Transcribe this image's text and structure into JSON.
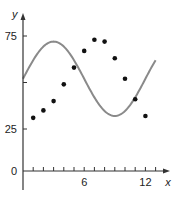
{
  "chart_data": {
    "type": "scatter",
    "title": "",
    "xlabel": "x",
    "ylabel": "y",
    "xlim": [
      0,
      13.5
    ],
    "ylim": [
      0,
      80
    ],
    "x_ticks": [
      1,
      2,
      3,
      4,
      5,
      6,
      7,
      8,
      9,
      10,
      11,
      12,
      13
    ],
    "x_tick_labels": [
      {
        "value": 6,
        "label": "6"
      },
      {
        "value": 12,
        "label": "12"
      }
    ],
    "y_tick_labels": [
      {
        "value": 0,
        "label": "0"
      },
      {
        "value": 25,
        "label": "25"
      },
      {
        "value": 75,
        "label": "75"
      }
    ],
    "y_extra_ticks": [
      50
    ],
    "grid": false,
    "legend": null,
    "series": [
      {
        "name": "data points",
        "kind": "scatter",
        "x": [
          1,
          2,
          3,
          4,
          5,
          6,
          7,
          8,
          9,
          10,
          11,
          12
        ],
        "y": [
          31,
          35,
          40,
          49,
          58,
          67,
          73,
          72,
          63,
          52,
          41,
          32
        ],
        "color": "#111111"
      },
      {
        "name": "sinusoidal curve",
        "kind": "line",
        "formula": "y = 52 + 20 sin(pi x / 6)",
        "x_range": [
          0,
          13
        ],
        "color": "#8a8a8a"
      }
    ]
  }
}
